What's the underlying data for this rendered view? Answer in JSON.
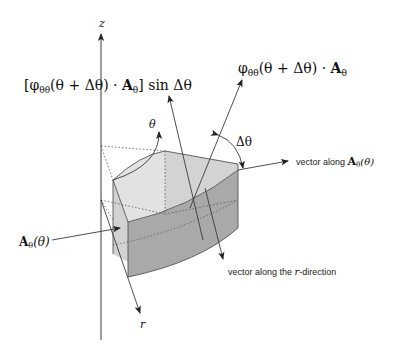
{
  "diagram": {
    "colors": {
      "line": "#3a3a3a",
      "top_face": "#e2e2e2",
      "side_face": "#c8c8c8",
      "front_face": "#a9a9a9",
      "dotted": "#555555",
      "background": "#ffffff"
    },
    "axes": {
      "z_label": "z",
      "r_label": "r",
      "theta_label": "θ"
    },
    "labels": {
      "top_left_expr_part1": "[φ",
      "top_left_sub": "θθ",
      "top_left_expr_part2": "(θ + Δθ) · ",
      "top_left_bold": "A",
      "top_left_sub2": "θ",
      "top_left_expr_part3": "] sin Δθ",
      "top_right_expr_part1": "φ",
      "top_right_sub": "θθ",
      "top_right_expr_part2": "(θ + Δθ) · ",
      "top_right_bold": "A",
      "top_right_sub2": "θ",
      "delta_theta": "Δθ",
      "vector_along_A_text": "vector along ",
      "vector_along_A_bold": "A",
      "vector_along_A_sub": "θ",
      "vector_along_A_arg": "(θ)",
      "A_theta_bold": "A",
      "A_theta_sub": "θ",
      "A_theta_arg": "(θ)",
      "vector_r_text1": "vector along the ",
      "vector_r_italic": "r",
      "vector_r_text2": "-direction"
    }
  }
}
